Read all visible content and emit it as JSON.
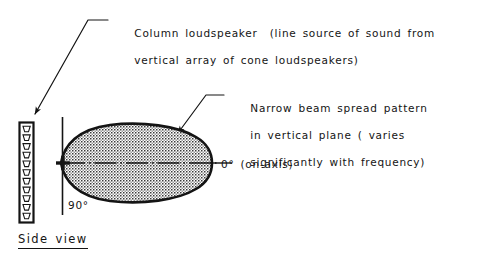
{
  "figure": {
    "background_color": "#ffffff",
    "ink_color": "#141414",
    "lobe_fill_color": "#d9d9d9"
  },
  "annotations": {
    "speaker_callout": {
      "line1": "Column loudspeaker  (line source of sound from",
      "line2": "vertical array of cone loudspeakers)"
    },
    "beam_callout": {
      "line1": "Narrow beam spread pattern",
      "line2": "in vertical plane ( varies",
      "line3": "significantly with frequency)"
    }
  },
  "labels": {
    "on_axis": "0° (on-axis)",
    "ninety_degrees": "90°",
    "view_caption": "Side view"
  },
  "diagram_data": {
    "type": "polar-beam-pattern",
    "plane": "vertical",
    "axis_reference_deg": 0,
    "perpendicular_reference_deg": 90,
    "source": {
      "name": "column loudspeaker",
      "driver_count": 11,
      "driver_type": "cone loudspeaker",
      "arrangement": "vertical line array"
    },
    "beam": {
      "shape": "narrow elongated lobe",
      "orientation": "horizontal, centered on 0° on-axis",
      "frequency_dependent": true
    }
  }
}
